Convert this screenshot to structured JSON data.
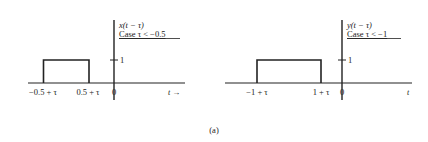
{
  "figure_label": "(a)",
  "plots": [
    {
      "function_label": "x(t − τ)",
      "case_label": "Case τ < −0.5",
      "y_tick_label": "1",
      "x_tick_labels": [
        "−0.5 + τ",
        "0.5 + τ"
      ],
      "origin_label": "0",
      "x_axis_label": "t →",
      "pulse": {
        "start": "-0.5 + τ",
        "end": "0.5 + τ",
        "height": 1
      }
    },
    {
      "function_label": "y(t − τ)",
      "case_label": "Case τ < −1",
      "y_tick_label": "1",
      "x_tick_labels": [
        "−1 + τ",
        "1 + τ"
      ],
      "origin_label": "0",
      "x_axis_label": "t",
      "pulse": {
        "start": "-1 + τ",
        "end": "1 + τ",
        "height": 1
      }
    }
  ],
  "colors": {
    "ink": "#222222",
    "background": "#ffffff"
  }
}
